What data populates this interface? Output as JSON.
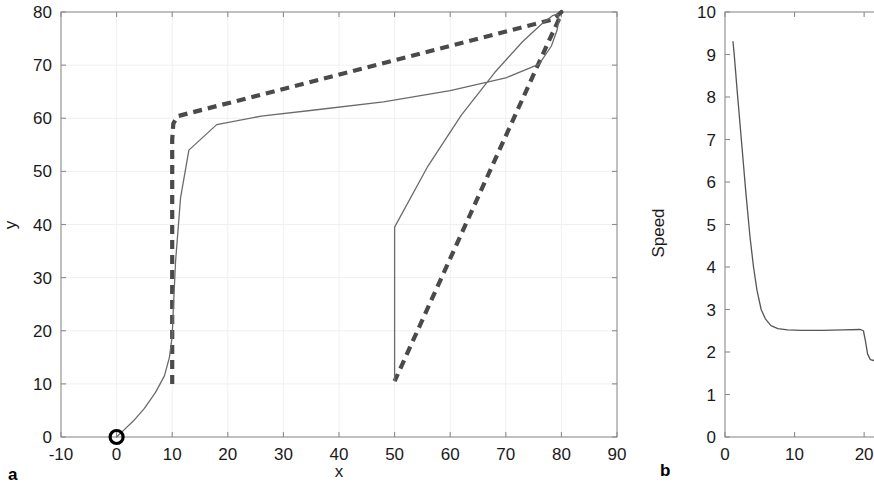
{
  "figure": {
    "background": "#ffffff",
    "line_color_solid": "#6b6b6b",
    "line_color_dashed": "#4a4a4a",
    "axis_color": "#8c8c8c",
    "text_color": "#1a1a1a"
  },
  "panels": {
    "a": {
      "label": "a",
      "xlabel": "x",
      "ylabel": "y"
    },
    "b": {
      "label": "b",
      "xlabel": "",
      "ylabel": "Speed"
    }
  },
  "chart_data": [
    {
      "type": "line",
      "panel": "a",
      "title": "",
      "xlabel": "x",
      "ylabel": "y",
      "xlim": [
        -10,
        90
      ],
      "ylim": [
        0,
        80
      ],
      "xticks": [
        -10,
        0,
        10,
        20,
        30,
        40,
        50,
        60,
        70,
        80,
        90
      ],
      "yticks": [
        0,
        10,
        20,
        30,
        40,
        50,
        60,
        70,
        80
      ],
      "grid": true,
      "legend": "none",
      "annotations": [
        {
          "name": "start-marker",
          "shape": "circle",
          "x": 0,
          "y": 0,
          "label": ""
        }
      ],
      "series": [
        {
          "name": "reference-path",
          "style": "dashed",
          "color": "#4a4a4a",
          "x": [
            10,
            10,
            10.2,
            11,
            78.5,
            80,
            79.5,
            77.5,
            50
          ],
          "y": [
            10,
            56,
            59,
            60.4,
            78.6,
            80,
            78.5,
            74,
            10.5
          ]
        },
        {
          "name": "vehicle-trajectory",
          "style": "solid",
          "color": "#6b6b6b",
          "x": [
            0,
            1.2,
            3,
            5,
            7,
            8.6,
            9.5,
            10,
            10.2,
            10.6,
            11.5,
            13,
            18,
            26,
            36,
            48,
            60,
            70,
            76,
            78.2,
            79.2,
            79.6,
            79.3,
            78.4,
            76.5,
            73,
            68,
            62,
            56,
            50,
            50
          ],
          "y": [
            0,
            1.2,
            3,
            5.4,
            8.4,
            11.5,
            15,
            19,
            24,
            33,
            45,
            54,
            58.8,
            60.4,
            61.6,
            63.1,
            65.2,
            67.6,
            70.2,
            73.6,
            76.5,
            78.6,
            79.6,
            79.3,
            77.8,
            74.4,
            68.6,
            60.6,
            51,
            39.5,
            10.6
          ]
        }
      ]
    },
    {
      "type": "line",
      "panel": "b",
      "title": "",
      "xlabel": "",
      "ylabel": "Speed",
      "xlim": [
        0,
        23
      ],
      "ylim": [
        0,
        10
      ],
      "xticks": [
        0,
        10,
        20
      ],
      "yticks": [
        0,
        1,
        2,
        3,
        4,
        5,
        6,
        7,
        8,
        9,
        10
      ],
      "grid": false,
      "legend": "none",
      "series": [
        {
          "name": "speed-profile",
          "style": "solid",
          "color": "#555555",
          "x": [
            1.15,
            1.3,
            1.8,
            2.4,
            3.0,
            3.6,
            4.1,
            4.6,
            5.2,
            5.8,
            6.6,
            7.6,
            9.0,
            11.0,
            14.0,
            17.0,
            19.4,
            19.9,
            20.2,
            20.5,
            20.9,
            21.4,
            22.0,
            22.6
          ],
          "y": [
            9.3,
            9.05,
            8.05,
            6.9,
            5.75,
            4.7,
            4.0,
            3.45,
            3.0,
            2.78,
            2.62,
            2.55,
            2.52,
            2.51,
            2.51,
            2.52,
            2.53,
            2.5,
            2.25,
            1.95,
            1.82,
            1.8,
            1.79,
            1.78
          ]
        }
      ]
    }
  ]
}
